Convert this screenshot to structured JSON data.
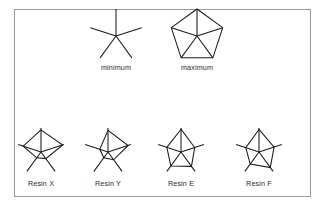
{
  "figure": {
    "background": "#ffffff",
    "frame_color": "#9a9a9a",
    "line_color": "#1a1a1a",
    "frame": {
      "x": 14,
      "y": 9,
      "width": 296,
      "height": 187
    }
  },
  "chart_data": {
    "type": "radar",
    "title": "",
    "subtitle": "",
    "xlabel": "",
    "ylabel": "",
    "grid": false,
    "legend_position": "none",
    "n_axes": 5,
    "axis_start_angle_deg": 90,
    "axis_direction": "counterclockwise",
    "value_range": [
      0,
      1
    ],
    "reference_glyphs": [
      {
        "label": "minimum",
        "name": "minimum",
        "values": [
          0,
          0,
          0,
          0,
          0
        ],
        "hull": false,
        "spokes_full_length": true,
        "center": {
          "x": 116,
          "y": 36
        },
        "radius": 27
      },
      {
        "label": "maximum",
        "name": "maximum",
        "values": [
          1,
          1,
          1,
          1,
          1
        ],
        "hull": true,
        "spokes_full_length": true,
        "center": {
          "x": 197,
          "y": 36
        },
        "radius": 27
      }
    ],
    "glyphs": [
      {
        "label": "Resin X",
        "name": "resin-x",
        "values": [
          0.92,
          0.78,
          0.3,
          0.34,
          0.95
        ],
        "hull": true,
        "center": {
          "x": 41,
          "y": 152
        },
        "radius": 24
      },
      {
        "label": "Resin Y",
        "name": "resin-y",
        "values": [
          0.9,
          0.36,
          0.3,
          0.4,
          0.88
        ],
        "hull": true,
        "center": {
          "x": 108,
          "y": 152
        },
        "radius": 24
      },
      {
        "label": "Resin E",
        "name": "resin-e",
        "values": [
          0.95,
          0.62,
          0.72,
          0.74,
          0.6
        ],
        "hull": true,
        "center": {
          "x": 181,
          "y": 152
        },
        "radius": 24
      },
      {
        "label": "Resin F",
        "name": "resin-f",
        "values": [
          0.94,
          0.58,
          0.62,
          0.8,
          0.66
        ],
        "hull": true,
        "center": {
          "x": 259,
          "y": 152
        },
        "radius": 24
      }
    ],
    "label_offset_y": 34
  }
}
